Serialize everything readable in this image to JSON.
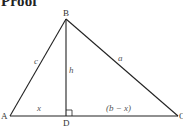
{
  "heading": "Proof",
  "diagram": {
    "vertices": {
      "A": {
        "label": "A",
        "x": 10,
        "y": 116
      },
      "B": {
        "label": "B",
        "x": 66,
        "y": 19
      },
      "C": {
        "label": "C",
        "x": 178,
        "y": 116
      },
      "D": {
        "label": "D",
        "x": 66,
        "y": 116
      }
    },
    "side_labels": {
      "c": "c",
      "a": "a",
      "h": "h",
      "x": "x",
      "b_minus_x": "(b − x)"
    },
    "right_angle_at": "D",
    "line_color": "#222222"
  }
}
